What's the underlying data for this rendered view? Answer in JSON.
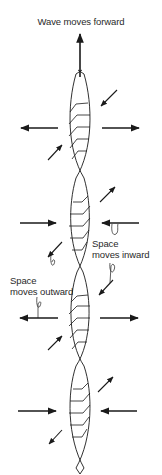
{
  "diagram": {
    "title": "Wave moves forward",
    "labels": {
      "space_inward_line1": "Space",
      "space_inward_line2": "moves inward",
      "space_outward_line1": "Space",
      "space_outward_line2": "moves outward"
    },
    "colors": {
      "stroke": "#1a1a1a",
      "text": "#2a2a2a",
      "background": "#ffffff"
    },
    "icons": {
      "forward_arrow": "arrow-up-icon",
      "outward_arrow": "arrow-horizontal-outward-icon",
      "inward_arrow": "arrow-horizontal-inward-icon",
      "diagonal_arrow": "arrow-diagonal-icon",
      "curly_pointer": "curly-pointer-icon"
    },
    "segments": [
      {
        "y_center": 128,
        "horizontal_flow": "outward"
      },
      {
        "y_center": 223,
        "horizontal_flow": "inward"
      },
      {
        "y_center": 318,
        "horizontal_flow": "outward"
      },
      {
        "y_center": 411,
        "horizontal_flow": "inward"
      }
    ]
  }
}
